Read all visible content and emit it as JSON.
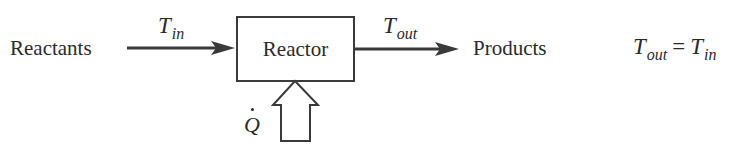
{
  "diagram": {
    "type": "process-flow",
    "nodes": {
      "input": {
        "label": "Reactants"
      },
      "reactor": {
        "label": "Reactor"
      },
      "output": {
        "label": "Products"
      }
    },
    "streams": {
      "inlet": {
        "symbol": "T",
        "subscript": "in"
      },
      "outlet": {
        "symbol": "T",
        "subscript": "out"
      }
    },
    "heat_input": {
      "symbol": "Q",
      "accent": "dot"
    },
    "equation": {
      "lhs_symbol": "T",
      "lhs_subscript": "out",
      "operator": "=",
      "rhs_symbol": "T",
      "rhs_subscript": "in"
    },
    "colors": {
      "ink": "#2a2a2a",
      "arrow": "#3a3a3a",
      "background": "#ffffff"
    }
  }
}
